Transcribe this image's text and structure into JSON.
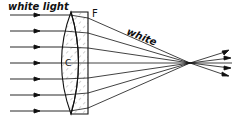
{
  "diagram": {
    "labels": {
      "incoming": "white light",
      "flint": "F",
      "crown": "C",
      "outgoing": "white"
    },
    "colors": {
      "line": "#111111",
      "background": "#ffffff"
    },
    "ray_y": [
      15,
      31,
      47,
      63,
      79,
      95,
      111
    ],
    "focal_point": [
      190,
      63
    ]
  }
}
